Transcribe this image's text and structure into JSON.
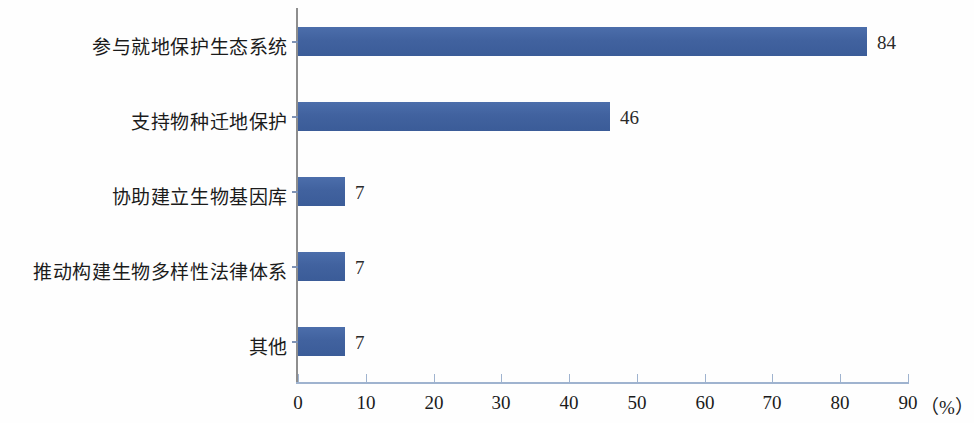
{
  "chart_data": {
    "type": "bar",
    "orientation": "horizontal",
    "title": "",
    "subtitle": "",
    "xlabel": "（%）",
    "ylabel": "",
    "categories": [
      "参与就地保护生态系统",
      "支持物种迁地保护",
      "协助建立生物基因库",
      "推动构建生物多样性法律体系",
      "其他"
    ],
    "values": [
      84,
      46,
      7,
      7,
      7
    ],
    "value_labels": [
      "84",
      "46",
      "7",
      "7",
      "7"
    ],
    "xlim": [
      0,
      90
    ],
    "xticks": [
      0,
      10,
      20,
      30,
      40,
      50,
      60,
      70,
      80,
      90
    ],
    "xtick_labels": [
      "0",
      "10",
      "20",
      "30",
      "40",
      "50",
      "60",
      "70",
      "80",
      "90"
    ],
    "grid": false,
    "legend": null,
    "series": [
      {
        "name": "",
        "values": [
          84,
          46,
          7,
          7,
          7
        ]
      }
    ],
    "colors": {
      "bar": "#41629f",
      "bar_highlight": "#4c6eab",
      "bar_shadow": "#3b5c98",
      "y_axis": "#8e8e8e",
      "x_axis": "#9fb3cf",
      "text": "#1b1b1b",
      "background": "#fefefe"
    }
  }
}
